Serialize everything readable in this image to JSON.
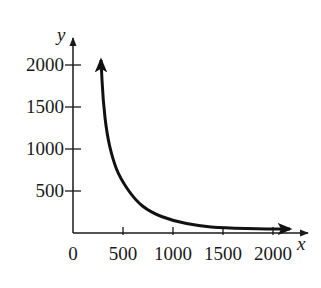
{
  "header": {
    "cut_off_text": "ᵍ"
  },
  "chart_data": {
    "type": "line",
    "title": "",
    "xlabel": "x",
    "ylabel": "y",
    "xlim": [
      0,
      2200
    ],
    "ylim": [
      0,
      2150
    ],
    "grid": false,
    "legend": null,
    "x_ticks": [
      0,
      500,
      1000,
      1500,
      2000
    ],
    "x_tick_labels": [
      "0",
      "500",
      "1000",
      "1500",
      "2000"
    ],
    "y_ticks": [
      500,
      1000,
      1500,
      2000
    ],
    "y_tick_labels": [
      "500",
      "1000",
      "1500",
      "2000"
    ],
    "series": [
      {
        "name": "curve",
        "arrows_both_ends": true,
        "x": [
          280,
          300,
          340,
          400,
          470,
          620,
          770,
          1000,
          1270,
          1490,
          1970,
          2170
        ],
        "y": [
          2060,
          1583,
          1167,
          869,
          655,
          393,
          250,
          143,
          83,
          60,
          48,
          48
        ]
      }
    ],
    "colors": {
      "line": "#111111",
      "axis": "#1a1a1a"
    }
  }
}
